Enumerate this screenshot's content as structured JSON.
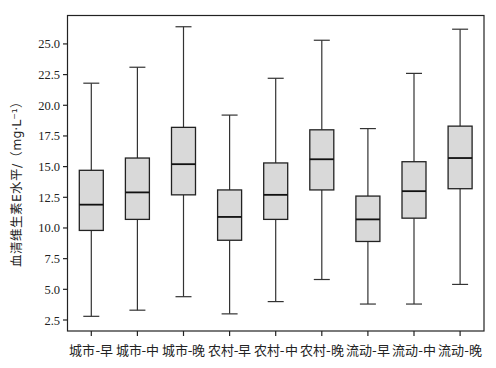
{
  "chart_data": {
    "type": "box",
    "title": "",
    "xlabel": "",
    "ylabel": "血清维生素E水平/（mg·L⁻¹）",
    "ylim": [
      1.5,
      27.5
    ],
    "yticks": [
      2.5,
      5.0,
      7.5,
      10.0,
      12.5,
      15.0,
      17.5,
      20.0,
      22.5,
      25.0
    ],
    "ytick_labels": [
      "2.5",
      "5.0",
      "7.5",
      "10.0",
      "12.5",
      "15.0",
      "17.5",
      "20.0",
      "22.5",
      "25.0"
    ],
    "grid": false,
    "legend": null,
    "categories": [
      "城市-早",
      "城市-中",
      "城市-晚",
      "农村-早",
      "农村-中",
      "农村-晚",
      "流动-早",
      "流动-中",
      "流动-晚"
    ],
    "series": [
      {
        "name": "城市-早",
        "min": 2.8,
        "q1": 9.8,
        "median": 11.9,
        "q3": 14.7,
        "max": 21.8
      },
      {
        "name": "城市-中",
        "min": 3.3,
        "q1": 10.7,
        "median": 12.9,
        "q3": 15.7,
        "max": 23.1
      },
      {
        "name": "城市-晚",
        "min": 4.4,
        "q1": 12.7,
        "median": 15.2,
        "q3": 18.2,
        "max": 26.4
      },
      {
        "name": "农村-早",
        "min": 3.0,
        "q1": 9.0,
        "median": 10.9,
        "q3": 13.1,
        "max": 19.2
      },
      {
        "name": "农村-中",
        "min": 4.0,
        "q1": 10.7,
        "median": 12.7,
        "q3": 15.3,
        "max": 22.2
      },
      {
        "name": "农村-晚",
        "min": 5.8,
        "q1": 13.1,
        "median": 15.6,
        "q3": 18.0,
        "max": 25.3
      },
      {
        "name": "流动-早",
        "min": 3.8,
        "q1": 8.9,
        "median": 10.7,
        "q3": 12.6,
        "max": 18.1
      },
      {
        "name": "流动-中",
        "min": 3.8,
        "q1": 10.8,
        "median": 13.0,
        "q3": 15.4,
        "max": 22.6
      },
      {
        "name": "流动-晚",
        "min": 5.4,
        "q1": 13.2,
        "median": 15.7,
        "q3": 18.3,
        "max": 26.2
      }
    ],
    "colors": {
      "box_fill": "#d9d9d9",
      "line": "#222222"
    }
  }
}
